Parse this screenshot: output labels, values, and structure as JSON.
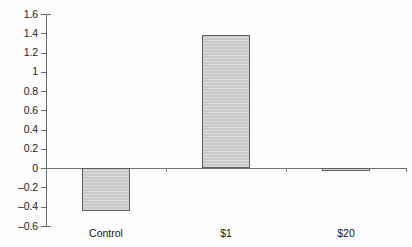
{
  "chart_data": {
    "type": "bar",
    "title": "",
    "subtitle": "",
    "xlabel": "",
    "ylabel": "",
    "categories": [
      "Control",
      "$1",
      "$20"
    ],
    "values": [
      -0.44,
      1.38,
      -0.03
    ],
    "series": [
      {
        "name": "",
        "values": [
          -0.44,
          1.38,
          -0.03
        ]
      }
    ],
    "ylim": [
      -0.6,
      1.6
    ],
    "ytick_values": [
      1.6,
      1.4,
      1.2,
      1,
      0.8,
      0.6,
      0.4,
      0.2,
      0,
      -0.2,
      -0.4,
      -0.6
    ],
    "ytick_labels": [
      "1.6",
      "1.4",
      "1.2",
      "1",
      "0.8",
      "0.6",
      "0.4",
      "0.2",
      "0",
      "–0.2",
      "–0.4",
      "–0.6"
    ],
    "grid": false,
    "legend": null,
    "legend_position": "none",
    "zero_line": true,
    "bar_fill_color": "#c9c9c9",
    "bar_border_color": "#5e5e5e",
    "axis_color": "#6a6a6a",
    "background_color": "#fdfdfd",
    "text_color": "#161616"
  }
}
